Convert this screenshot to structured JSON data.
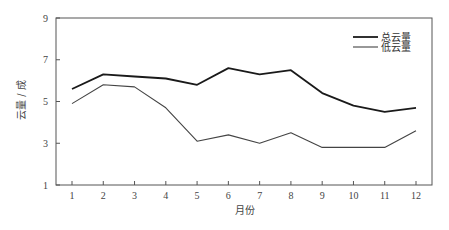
{
  "chart_data": {
    "type": "line",
    "title": "",
    "xlabel": "月份",
    "ylabel": "云量 / 成",
    "x": [
      1,
      2,
      3,
      4,
      5,
      6,
      7,
      8,
      9,
      10,
      11,
      12
    ],
    "x_tick_labels": [
      "1",
      "2",
      "3",
      "4",
      "5",
      "6",
      "7",
      "8",
      "9",
      "10",
      "11",
      "12"
    ],
    "y_ticks": [
      1,
      3,
      5,
      7,
      9
    ],
    "y_tick_labels": [
      "1",
      "3",
      "5",
      "7",
      "9"
    ],
    "ylim": [
      1,
      9
    ],
    "grid": false,
    "legend_position": "upper right",
    "series": [
      {
        "name": "总云量",
        "color": "#1a1a1a",
        "line_width": 1.8,
        "values": [
          5.6,
          6.3,
          6.2,
          6.1,
          5.8,
          6.6,
          6.3,
          6.5,
          5.4,
          4.8,
          4.5,
          4.7
        ]
      },
      {
        "name": "低云量",
        "color": "#444444",
        "line_width": 1.1,
        "values": [
          4.9,
          5.8,
          5.7,
          4.7,
          3.1,
          3.4,
          3.0,
          3.5,
          2.8,
          2.8,
          2.8,
          3.6
        ]
      }
    ]
  },
  "legend": {
    "items": [
      {
        "label": "总云量"
      },
      {
        "label": "低云量"
      }
    ]
  }
}
